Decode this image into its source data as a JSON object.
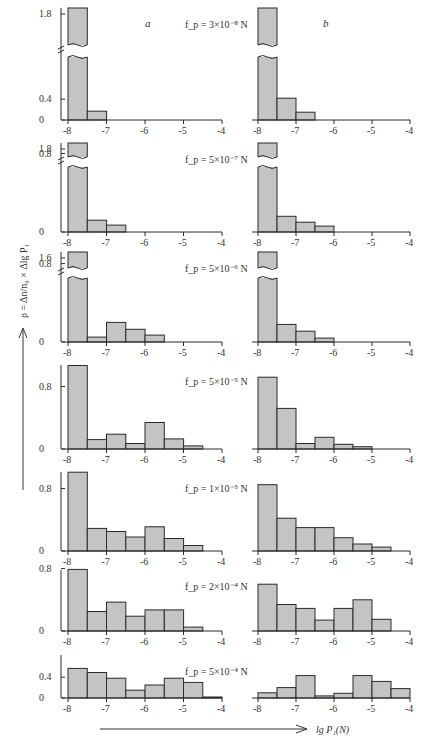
{
  "figure": {
    "column_labels": [
      "a",
      "b"
    ],
    "y_axis_title": "ρ = Δn/n₀ × Δlg P₁",
    "x_axis_title": "lg P₁(N)",
    "colors": {
      "bar_fill": "#c4c4c4",
      "bar_stroke": "#2a2a2a",
      "text": "#333333"
    }
  },
  "chart_data": {
    "type": "bar",
    "title": "",
    "xlabel": "lg P₁(N)",
    "ylabel": "ρ = Δn/n₀ × Δlg P₁",
    "x_ticks": [
      -8,
      -7,
      -6,
      -5,
      -4
    ],
    "xlim": [
      -8,
      -4
    ],
    "bin_width": 0.5,
    "bin_edges": [
      -8,
      -7.5,
      -7,
      -6.5,
      -6,
      -5.5,
      -5,
      -4.5,
      -4
    ],
    "grid": false,
    "panels": [
      {
        "fp_label": "f_p = 3×10⁻⁸ N",
        "y_ticks": [
          0,
          0.4,
          1.8
        ],
        "y_break": true,
        "a": [
          2.0,
          0.17,
          0,
          0,
          0,
          0,
          0,
          0
        ],
        "b": [
          2.0,
          0.42,
          0.15,
          0,
          0,
          0,
          0,
          0
        ]
      },
      {
        "fp_label": "f_p = 5×10⁻⁷ N",
        "y_ticks": [
          0,
          0.8,
          1.8
        ],
        "y_break": true,
        "a": [
          2.0,
          0.12,
          0.07,
          0,
          0,
          0,
          0,
          0
        ],
        "b": [
          2.0,
          0.16,
          0.1,
          0.06,
          0,
          0,
          0,
          0
        ]
      },
      {
        "fp_label": "f_p = 5×10⁻⁶ N",
        "y_ticks": [
          0,
          0.8,
          1.6
        ],
        "y_break": true,
        "a": [
          1.8,
          0.05,
          0.2,
          0.13,
          0.07,
          0,
          0,
          0
        ],
        "b": [
          1.8,
          0.18,
          0.11,
          0.04,
          0,
          0,
          0,
          0
        ]
      },
      {
        "fp_label": "f_p = 5×10⁻⁵ N",
        "y_ticks": [
          0,
          0.8
        ],
        "y_break": false,
        "a": [
          1.07,
          0.12,
          0.19,
          0.07,
          0.34,
          0.13,
          0.04,
          0
        ],
        "b": [
          0.92,
          0.52,
          0.07,
          0.15,
          0.06,
          0.03,
          0,
          0
        ]
      },
      {
        "fp_label": "f_p = 1×10⁻⁵ N",
        "y_ticks": [
          0,
          0.8
        ],
        "y_break": false,
        "a": [
          1.01,
          0.29,
          0.25,
          0.18,
          0.31,
          0.16,
          0.07,
          0
        ],
        "b": [
          0.85,
          0.42,
          0.3,
          0.3,
          0.17,
          0.09,
          0.05,
          0
        ]
      },
      {
        "fp_label": "f_p = 2×10⁻⁴ N",
        "y_ticks": [
          0,
          0.8
        ],
        "y_break": false,
        "a": [
          0.79,
          0.25,
          0.37,
          0.19,
          0.27,
          0.27,
          0.05,
          0
        ],
        "b": [
          0.6,
          0.34,
          0.29,
          0.14,
          0.29,
          0.4,
          0.15,
          0
        ]
      },
      {
        "fp_label": "f_p = 5×10⁻⁴ N",
        "y_ticks": [
          0,
          0.4
        ],
        "y_break": false,
        "a": [
          0.57,
          0.49,
          0.38,
          0.15,
          0.25,
          0.38,
          0.3,
          0.02
        ],
        "b": [
          0.1,
          0.2,
          0.43,
          0.04,
          0.09,
          0.43,
          0.32,
          0.18
        ]
      }
    ]
  }
}
